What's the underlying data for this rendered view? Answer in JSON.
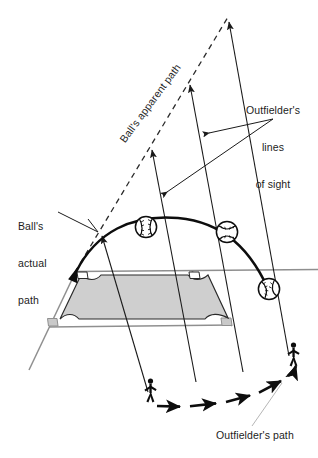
{
  "figure": {
    "type": "diagram",
    "background_color": "#ffffff",
    "ink_color": "#1a1a1a",
    "infield_fill": "#cfcfcf",
    "line_color_field": "#8a8a8a"
  },
  "labels": {
    "outfielders_lines_of_sight": "Outfielder's\nlines\nof sight",
    "outfielders_lines_of_sight_l1": "Outfielder's",
    "outfielders_lines_of_sight_l2": "lines",
    "outfielders_lines_of_sight_l3": "of sight",
    "balls_actual_path": "Ball's\nactual\npath",
    "balls_actual_path_l1": "Ball's",
    "balls_actual_path_l2": "actual",
    "balls_actual_path_l3": "path",
    "balls_apparent_path": "Ball's apparent path",
    "outfielders_path": "Outfielder's path"
  },
  "elements": {
    "baseballs": [
      {
        "name": "baseball-1",
        "cx": 146,
        "cy": 227,
        "r": 11
      },
      {
        "name": "baseball-2",
        "cx": 227,
        "cy": 232,
        "r": 11
      },
      {
        "name": "baseball-3",
        "cx": 269,
        "cy": 289,
        "r": 11
      }
    ],
    "fielders": [
      {
        "name": "outfielder-start",
        "x": 148,
        "y": 395
      },
      {
        "name": "outfielder-end",
        "x": 292,
        "y": 358
      }
    ],
    "sight_lines_count": 4,
    "convergence_point": {
      "x": 228,
      "y": 18
    }
  }
}
